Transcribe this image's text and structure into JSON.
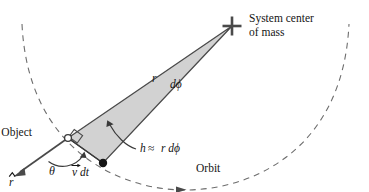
{
  "figure": {
    "type": "physics-diagram",
    "background_color": "#ffffff",
    "stroke_color": "#3a3a3a",
    "wedge_fill_color": "#d2d2d2",
    "wedge_stroke_color": "#4a4a4a",
    "dash_color": "#6b6b6b"
  },
  "labels": {
    "system_center_line1": "System center",
    "system_center_line2": "of mass",
    "object": "Object",
    "orbit": "Orbit",
    "radius_r": "r",
    "d_phi": "dϕ",
    "h_relation_h": "h",
    "h_relation_approx": "≈",
    "h_relation_rdphi": "r dϕ",
    "theta": "θ",
    "v_dt_v": "v",
    "v_dt_dt": "dt",
    "r_hat": "r"
  },
  "markers": {
    "center_of_mass_glyph": "cross-marker",
    "object_glyph": "open-circle",
    "position_glyph": "filled-dot",
    "right_angle_glyph": "right-angle-square",
    "orbit_direction_glyph": "arrowhead-right"
  },
  "geometry": {
    "center_of_mass": [
      232,
      26
    ],
    "object_point": [
      68,
      138
    ],
    "swept_point": [
      103,
      163
    ],
    "r_hat_tip": [
      14,
      176
    ],
    "orbit_arc_start": [
      22,
      24
    ],
    "orbit_arc_end": [
      349,
      24
    ],
    "orbit_direction_arrow_at": [
      182,
      180
    ]
  }
}
